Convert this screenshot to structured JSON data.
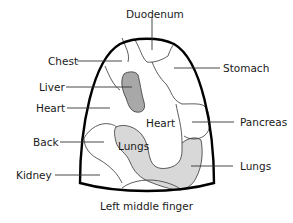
{
  "diagram": {
    "title": "Left middle finger",
    "colors": {
      "outline": "#000000",
      "liver_fill": "#a8a8a8",
      "lungs_fill": "#d8d8d8",
      "background": "#ffffff"
    },
    "labels": {
      "duodenum": "Duodenum",
      "chest": "Chest",
      "stomach": "Stomach",
      "liver": "Liver",
      "heart_left": "Heart",
      "heart_center": "Heart",
      "pancreas": "Pancreas",
      "back": "Back",
      "lungs_center": "Lungs",
      "lungs_right": "Lungs",
      "kidney": "Kidney"
    }
  }
}
